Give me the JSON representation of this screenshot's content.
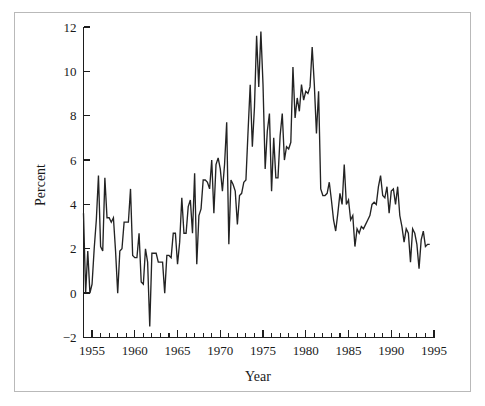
{
  "figure": {
    "title": "",
    "background_color": "#ffffff",
    "border_color": "#b9b9b9",
    "line_color": "#232323"
  },
  "axes": {
    "x_title": "Year",
    "y_title": "Percent",
    "x_tick_labels": [
      "1955",
      "1960",
      "1965",
      "1970",
      "1975",
      "1980",
      "1985",
      "1990",
      "1995"
    ],
    "y_tick_labels": [
      "12",
      "10",
      "8",
      "6",
      "4",
      "2",
      "0",
      "−2"
    ]
  },
  "chart_data": {
    "type": "line",
    "title": "",
    "xlabel": "Year",
    "ylabel": "Percent",
    "xlim": [
      1954.0,
      1995.0
    ],
    "ylim": [
      -2,
      12
    ],
    "xticks": [
      1955,
      1960,
      1965,
      1970,
      1975,
      1980,
      1985,
      1990,
      1995
    ],
    "yticks": [
      -2,
      0,
      2,
      4,
      6,
      8,
      10,
      12
    ],
    "x_minor_tick_interval": 1,
    "grid": false,
    "legend": null,
    "series": [
      {
        "name": "Percent",
        "x": [
          1954.0,
          1954.25,
          1954.5,
          1954.75,
          1955.0,
          1955.25,
          1955.5,
          1955.75,
          1956.0,
          1956.25,
          1956.5,
          1956.75,
          1957.0,
          1957.25,
          1957.5,
          1957.75,
          1958.0,
          1958.25,
          1958.5,
          1958.75,
          1959.0,
          1959.25,
          1959.5,
          1959.75,
          1960.0,
          1960.25,
          1960.5,
          1960.75,
          1961.0,
          1961.25,
          1961.5,
          1961.75,
          1962.0,
          1962.25,
          1962.5,
          1962.75,
          1963.0,
          1963.25,
          1963.5,
          1963.75,
          1964.0,
          1964.25,
          1964.5,
          1964.75,
          1965.0,
          1965.25,
          1965.5,
          1965.75,
          1966.0,
          1966.25,
          1966.5,
          1966.75,
          1967.0,
          1967.25,
          1967.5,
          1967.75,
          1968.0,
          1968.25,
          1968.5,
          1968.75,
          1969.0,
          1969.25,
          1969.5,
          1969.75,
          1970.0,
          1970.25,
          1970.5,
          1970.75,
          1971.0,
          1971.25,
          1971.5,
          1971.75,
          1972.0,
          1972.25,
          1972.5,
          1972.75,
          1973.0,
          1973.25,
          1973.5,
          1973.75,
          1974.0,
          1974.25,
          1974.5,
          1974.75,
          1975.0,
          1975.25,
          1975.5,
          1975.75,
          1976.0,
          1976.25,
          1976.5,
          1976.75,
          1977.0,
          1977.25,
          1977.5,
          1977.75,
          1978.0,
          1978.25,
          1978.5,
          1978.75,
          1979.0,
          1979.25,
          1979.5,
          1979.75,
          1980.0,
          1980.25,
          1980.5,
          1980.75,
          1981.0,
          1981.25,
          1981.5,
          1981.75,
          1982.0,
          1982.25,
          1982.5,
          1982.75,
          1983.0,
          1983.25,
          1983.5,
          1983.75,
          1984.0,
          1984.25,
          1984.5,
          1984.75,
          1985.0,
          1985.25,
          1985.5,
          1985.75,
          1986.0,
          1986.25,
          1986.5,
          1986.75,
          1987.0,
          1987.25,
          1987.5,
          1987.75,
          1988.0,
          1988.25,
          1988.5,
          1988.75,
          1989.0,
          1989.25,
          1989.5,
          1989.75,
          1990.0,
          1990.25,
          1990.5,
          1990.75,
          1991.0,
          1991.25,
          1991.5,
          1991.75,
          1992.0,
          1992.25,
          1992.5,
          1992.75,
          1993.0,
          1993.25,
          1993.5,
          1993.75,
          1994.0,
          1994.25,
          1994.5
        ],
        "y": [
          3.6,
          0.0,
          1.9,
          0.0,
          0.4,
          2.0,
          3.3,
          5.3,
          2.1,
          1.9,
          5.2,
          3.4,
          3.4,
          3.2,
          3.4,
          1.9,
          0.0,
          1.9,
          2.0,
          3.2,
          3.2,
          3.2,
          4.7,
          1.7,
          1.6,
          1.6,
          2.7,
          0.5,
          0.4,
          2.0,
          1.4,
          -1.5,
          1.8,
          1.8,
          1.8,
          1.4,
          1.4,
          1.4,
          0.0,
          1.7,
          1.7,
          1.6,
          2.7,
          2.7,
          1.3,
          2.3,
          4.3,
          2.7,
          2.7,
          3.9,
          4.2,
          2.7,
          5.4,
          1.3,
          3.5,
          3.8,
          5.1,
          5.1,
          5.0,
          4.7,
          6.0,
          3.6,
          5.8,
          6.1,
          5.6,
          4.6,
          5.8,
          7.7,
          2.2,
          5.1,
          4.9,
          4.6,
          3.1,
          4.4,
          4.5,
          5.0,
          5.1,
          7.3,
          9.4,
          6.6,
          8.4,
          11.6,
          9.3,
          11.8,
          9.4,
          5.6,
          7.3,
          8.1,
          4.6,
          7.0,
          5.2,
          5.2,
          7.1,
          8.1,
          6.0,
          6.6,
          6.5,
          6.8,
          10.2,
          7.9,
          8.8,
          8.2,
          9.4,
          8.7,
          9.1,
          9.0,
          9.3,
          11.1,
          9.4,
          7.2,
          9.1,
          4.7,
          4.4,
          4.4,
          4.5,
          5.0,
          4.2,
          3.3,
          2.8,
          3.6,
          4.5,
          4.0,
          5.8,
          4.0,
          4.2,
          3.3,
          3.5,
          2.1,
          2.9,
          2.7,
          3.0,
          2.9,
          3.1,
          3.3,
          3.5,
          4.0,
          4.1,
          4.0,
          4.8,
          5.3,
          4.4,
          4.3,
          4.8,
          3.6,
          4.6,
          4.7,
          4.0,
          4.8,
          3.5,
          3.0,
          2.3,
          2.9,
          2.7,
          1.4,
          2.9,
          2.7,
          2.2,
          1.1,
          2.4,
          2.8,
          2.1,
          2.2,
          2.2
        ]
      }
    ]
  }
}
